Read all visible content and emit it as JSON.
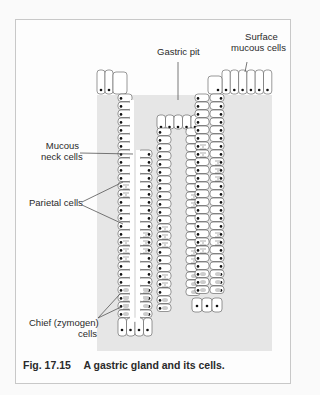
{
  "figure": {
    "title": "A gastric gland and its cells.",
    "number": "Fig. 17.15",
    "labels": {
      "gastric_pit": "Gastric pit",
      "surface_mucous_line1": "Surface",
      "surface_mucous_line2": "mucous cells",
      "mucous_neck_line1": "Mucous",
      "mucous_neck_line2": "neck cells",
      "parietal": "Parietal cells",
      "chief_line1": "Chief (zymogen)",
      "chief_line2": "cells"
    }
  },
  "colors": {
    "tissue_background": "#e6e6e6",
    "cell_outline": "#555555",
    "nucleus": "#111111",
    "leader_line": "#555555"
  }
}
